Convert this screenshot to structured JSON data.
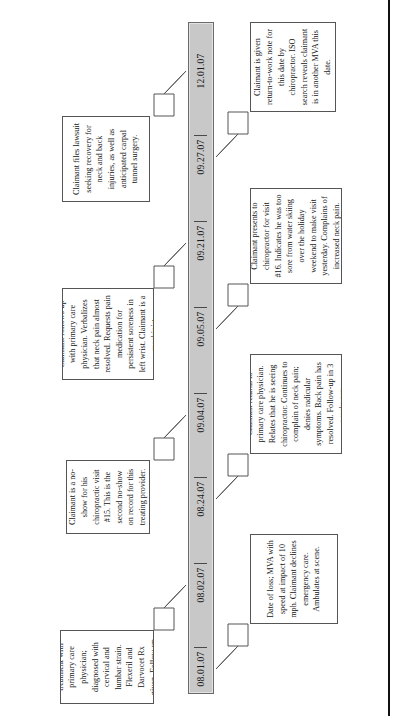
{
  "document": {
    "type": "medical-claim-timeline",
    "orientation": "landscape-rotated"
  },
  "timeline": {
    "dates": [
      "08.01.07",
      "08.02.07",
      "08.24.07",
      "09.04.07",
      "09.05.07",
      "09.21.07",
      "09.27.07",
      "12.01.07"
    ]
  },
  "notes": {
    "n1": {
      "date": "08.01.07",
      "side": "below",
      "text": "Date of loss; MVA with speed at impact of 10 mph. Claimant declines emergency care. Ambulates at scene."
    },
    "n2": {
      "date": "08.02.07",
      "side": "above",
      "text": "Claimant seeks treatment with primary care physician; diagnosed with cervical and lumbar strain. Flexeril and Darvocet Rx given. Follow-up in 3 weeks prn."
    },
    "n3": {
      "date": "08.24.07",
      "side": "below",
      "text": "Claimant returns to primary care physician. Relates that he is seeing chiropractor. Continues to complain of neck pain; denies radicular symptoms. Back pain has resolved. Follow-up in 3 weeks prn."
    },
    "n4": {
      "date": "09.04.07",
      "side": "above",
      "text": "Claimant is a no-show for his chiropractic visit #15. This is the second no-show on record for this treating provider."
    },
    "n5": {
      "date": "09.05.07",
      "side": "below",
      "text": "Claimant presents to chiropractor for visit #16. Indicates he was too sore from water skiing over the holiday weekend to make visit yesterday. Complains of increased neck pain."
    },
    "n6": {
      "date": "09.21.07",
      "side": "above",
      "text": "Claimant follows-up with primary care physician. Verbalizes that neck pain almost resolved. Requests pain medication for persistent soreness in left wrist. Claimant is a machinist."
    },
    "n7": {
      "date": "09.27.07",
      "side": "below",
      "text": "Claimant is given return-to-work note for this date by chiropractor. ISO search reveals claimant is in another MVA this date."
    },
    "n8": {
      "date": "12.01.07",
      "side": "above",
      "text": "Claimant files lawsuit seeking recovery for neck and back injuries, as well as anticipated carpal tunnel surgery."
    }
  },
  "colors": {
    "bar_fill": "#c8c8c8",
    "bar_border": "#6b6b6b",
    "box_border": "#555555",
    "page_edge": "#111111",
    "text": "#141414"
  }
}
